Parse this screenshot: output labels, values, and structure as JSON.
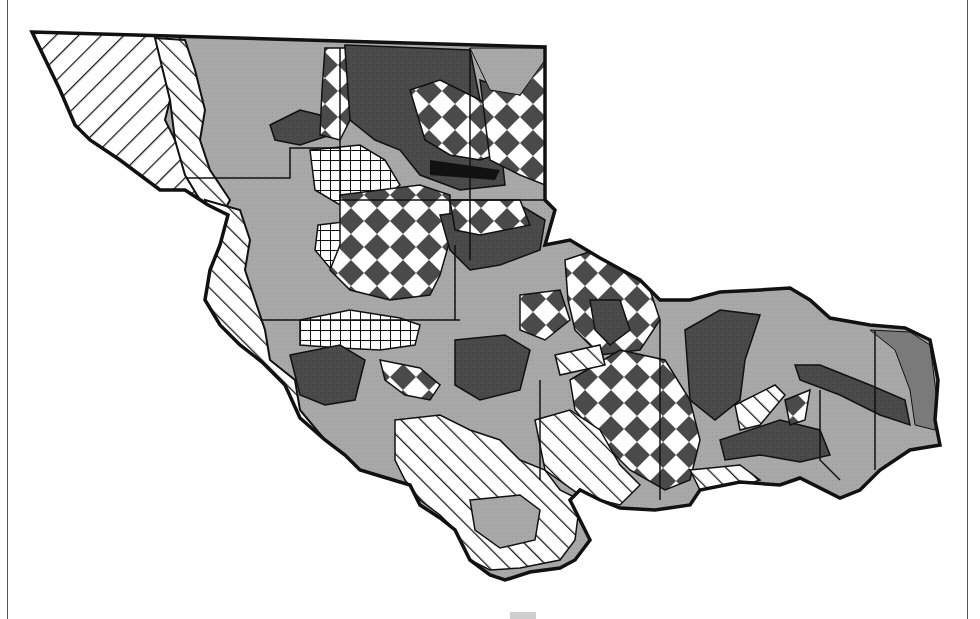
{
  "figure": {
    "type": "thematic-map",
    "title": "",
    "frame": {
      "left_rule": true,
      "right_rule": true
    }
  },
  "map": {
    "fills": {
      "light_gray": "#a8a8a8",
      "dark_gray": "#4a4a4a",
      "medium_gray": "#7a7a7a",
      "black": "#111111",
      "white": "#ffffff",
      "outline": "#111111"
    },
    "patterns": [
      {
        "id": "light-gray-fill",
        "name": "Light gray solid"
      },
      {
        "id": "dark-gray-fill",
        "name": "Dark gray solid"
      },
      {
        "id": "diamond-checker",
        "name": "Diamond checkerboard"
      },
      {
        "id": "crosshatch-grid",
        "name": "Square crosshatch grid"
      },
      {
        "id": "stripes-down",
        "name": "Diagonal stripes (NW-SE)"
      },
      {
        "id": "stripes-up",
        "name": "Diagonal stripes (SW-NE)"
      }
    ],
    "regions": [
      {
        "name": "northwest-stripes",
        "pattern": "stripes-down"
      },
      {
        "name": "west-coast-stripes",
        "pattern": "stripes-up"
      },
      {
        "name": "north-gray",
        "pattern": "light-gray-fill"
      },
      {
        "name": "north-dark-core",
        "pattern": "dark-gray-fill"
      },
      {
        "name": "north-diamonds",
        "pattern": "diamond-checker"
      },
      {
        "name": "west-crosshatch",
        "pattern": "crosshatch-grid"
      },
      {
        "name": "central-diamonds",
        "pattern": "diamond-checker"
      },
      {
        "name": "east-diamonds",
        "pattern": "diamond-checker"
      },
      {
        "name": "south-stripes",
        "pattern": "stripes-up"
      },
      {
        "name": "east-dark-bands",
        "pattern": "dark-gray-fill"
      }
    ]
  }
}
